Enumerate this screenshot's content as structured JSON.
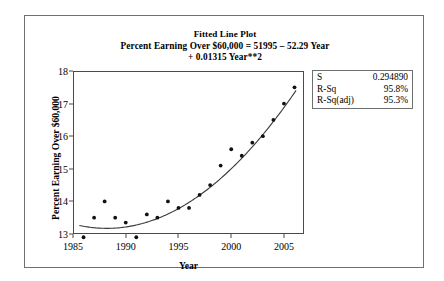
{
  "figure": {
    "title_lines": [
      "Fitted Line Plot",
      "Percent Earning Over $60,000 = 51995 – 52.29 Year",
      "+ 0.01315 Year**2"
    ],
    "x_axis_title": "Year",
    "y_axis_title": "Percent Earning Over $60,000"
  },
  "stats": {
    "rows": [
      {
        "key": "S",
        "value": "0.294890"
      },
      {
        "key": "R-Sq",
        "value": "95.8%"
      },
      {
        "key": "R-Sq(adj)",
        "value": "95.3%"
      }
    ]
  },
  "chart_data": {
    "type": "scatter",
    "title": "Fitted Line Plot",
    "subtitle": "Percent Earning Over $60,000 = 51995 – 52.29 Year + 0.01315 Year**2",
    "xlabel": "Year",
    "ylabel": "Percent Earning Over $60,000",
    "xlim": [
      1985,
      2006.9
    ],
    "ylim": [
      13,
      18
    ],
    "xticks": [
      1985,
      1990,
      1995,
      2000,
      2005
    ],
    "yticks": [
      13,
      14,
      15,
      16,
      17,
      18
    ],
    "grid": false,
    "legend": "none",
    "x": [
      1986,
      1987,
      1988,
      1989,
      1990,
      1991,
      1992,
      1993,
      1994,
      1995,
      1996,
      1997,
      1998,
      1999,
      2000,
      2001,
      2002,
      2003,
      2004,
      2005,
      2006
    ],
    "y": [
      12.9,
      13.5,
      14.0,
      13.5,
      13.35,
      12.9,
      13.6,
      13.5,
      14.0,
      13.8,
      13.8,
      14.2,
      14.5,
      15.1,
      15.6,
      15.4,
      15.8,
      16.0,
      16.5,
      17.0,
      17.5
    ],
    "marker": "filled-circle",
    "fit": {
      "type": "quadratic",
      "equation": "Percent Earning Over $60,000 = 51995 – 52.29 Year + 0.01315 Year**2",
      "intercept": 51995,
      "linear_coef": -52.29,
      "quadratic_coef": 0.01315,
      "s": 0.29489,
      "r_sq": "95.8%",
      "r_sq_adj": "95.3%"
    }
  }
}
